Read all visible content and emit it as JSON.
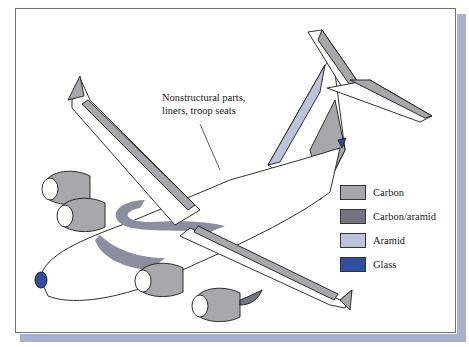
{
  "figure": {
    "callout": {
      "line1": "Nonstructural parts,",
      "line2": "liners, troop seats"
    },
    "legend": [
      {
        "label": "Carbon",
        "color": "#a7a8ab"
      },
      {
        "label": "Carbon/aramid",
        "color": "#72757f"
      },
      {
        "label": "Aramid",
        "color": "#bcc3dc"
      },
      {
        "label": "Glass",
        "color": "#2f4ea0"
      }
    ],
    "colors": {
      "frame_shadow": "#a9b0cc",
      "frame_border": "#6b6f80",
      "outline": "#1a1a1a"
    }
  }
}
